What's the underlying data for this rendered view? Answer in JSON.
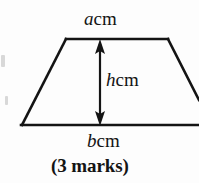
{
  "figure": {
    "type": "trapezium-diagram",
    "ink_color": "#141414",
    "background_color": "#fdfdfd",
    "labels": {
      "top_side": {
        "variable": "a",
        "unit": "cm"
      },
      "height": {
        "variable": "h",
        "unit": "cm"
      },
      "bottom_side": {
        "variable": "b",
        "unit": "cm"
      }
    },
    "shape": {
      "top_left": [
        66,
        39
      ],
      "top_right": [
        168,
        39
      ],
      "bottom_left": [
        22,
        125
      ],
      "bottom_right": [
        199,
        125
      ],
      "stroke_width": 2.6
    },
    "height_arrow": {
      "x": 100,
      "y_top": 40,
      "y_bottom": 125,
      "double_headed": true
    }
  },
  "question": {
    "marks_text": "(3 marks)"
  }
}
